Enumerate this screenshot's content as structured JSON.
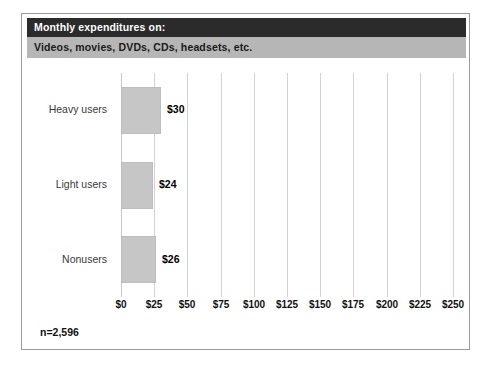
{
  "figure": {
    "title": "Monthly expenditures on:",
    "subtitle": "Videos, movies, DVDs, CDs, headsets, etc.",
    "sample_note": "n=2,596",
    "colors": {
      "title_band": "#2b2b2b",
      "title_text": "#ffffff",
      "subtitle_band": "#b6b6b6",
      "subtitle_text": "#1a1a1a",
      "bar_fill": "#c6c6c6",
      "bar_edge": "#bdbdbd",
      "gridline": "#d2d2d2",
      "frame": "#9a9a9a",
      "plot_background": "#ffffff"
    }
  },
  "chart_data": {
    "type": "bar",
    "orientation": "horizontal",
    "title": "Monthly expenditures on:",
    "subtitle": "Videos, movies, DVDs, CDs, headsets, etc.",
    "categories": [
      "Heavy users",
      "Light users",
      "Nonusers"
    ],
    "values": [
      30,
      24,
      26
    ],
    "value_labels": [
      "$30",
      "$24",
      "$26"
    ],
    "xlabel": "",
    "ylabel": "",
    "xlim": [
      0,
      250
    ],
    "xtick_values": [
      0,
      25,
      50,
      75,
      100,
      125,
      150,
      175,
      200,
      225,
      250
    ],
    "xtick_labels": [
      "$0",
      "$25",
      "$50",
      "$75",
      "$100",
      "$125",
      "$150",
      "$175",
      "$200",
      "$225",
      "$250"
    ],
    "grid": true,
    "grid_axis": "x",
    "legend": false,
    "annotations": [
      "n=2,596"
    ],
    "units": "US dollars per month"
  }
}
